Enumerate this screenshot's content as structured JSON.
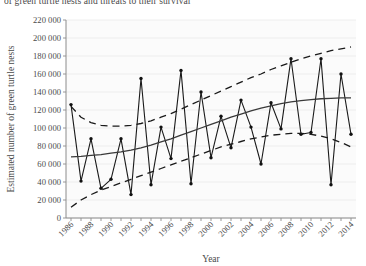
{
  "caption": {
    "clipped_top_text": "of green turtle nests and threats to their survival"
  },
  "chart_data": {
    "type": "line",
    "title": "",
    "subtitle": "",
    "xlabel": "Year",
    "ylabel": "Estimated number of green turtle nests",
    "xlim": [
      1985.5,
      2014.5
    ],
    "ylim": [
      0,
      220000
    ],
    "grid": true,
    "legend_position": "none",
    "y_ticks": [
      0,
      20000,
      40000,
      60000,
      80000,
      100000,
      120000,
      140000,
      160000,
      180000,
      200000,
      220000
    ],
    "y_tick_labels": [
      "0",
      "20 000",
      "40 000",
      "60 000",
      "80 000",
      "100 000",
      "120 000",
      "140 000",
      "160 000",
      "180 000",
      "200 000",
      "220 000"
    ],
    "x_ticks": [
      1986,
      1988,
      1990,
      1992,
      1994,
      1996,
      1998,
      2000,
      2002,
      2004,
      2006,
      2008,
      2010,
      2012,
      2014
    ],
    "x_tick_labels": [
      "1986",
      "1988",
      "1990",
      "1992",
      "1994",
      "1996",
      "1998",
      "2000",
      "2002",
      "2004",
      "2006",
      "2008",
      "2010",
      "2012",
      "2014"
    ],
    "x_minor_ticks_every": 1,
    "x": [
      1986,
      1987,
      1988,
      1989,
      1990,
      1991,
      1992,
      1993,
      1994,
      1995,
      1996,
      1997,
      1998,
      1999,
      2000,
      2001,
      2002,
      2003,
      2004,
      2005,
      2006,
      2007,
      2008,
      2009,
      2010,
      2011,
      2012,
      2013,
      2014
    ],
    "series": [
      {
        "name": "Estimated number of green turtle nests",
        "style": "solid-with-markers",
        "color": "#111111",
        "values": [
          126000,
          41000,
          88000,
          33000,
          43000,
          88000,
          26000,
          155000,
          37000,
          101000,
          66000,
          164000,
          38000,
          140000,
          67000,
          113000,
          78000,
          131000,
          101000,
          60000,
          128000,
          99000,
          177000,
          93000,
          95000,
          177000,
          37000,
          160000,
          93000
        ]
      },
      {
        "name": "Fitted trend",
        "style": "solid",
        "color": "#3a3a3a",
        "values": [
          68000,
          68500,
          69500,
          70500,
          72000,
          73500,
          75500,
          78000,
          81000,
          84500,
          88000,
          92000,
          96000,
          100000,
          104000,
          108000,
          112000,
          115500,
          119000,
          122000,
          124500,
          127000,
          129000,
          130500,
          131500,
          132500,
          133000,
          133500,
          133500
        ]
      },
      {
        "name": "Upper confidence limit",
        "style": "dashed",
        "color": "#1a1a1a",
        "values": [
          124000,
          112000,
          106000,
          103000,
          102000,
          102000,
          103000,
          105000,
          108000,
          112000,
          116000,
          121000,
          126000,
          131000,
          136000,
          141000,
          146000,
          151000,
          156000,
          160000,
          165000,
          169000,
          173000,
          177000,
          180000,
          183000,
          186000,
          188000,
          190000
        ]
      },
      {
        "name": "Lower confidence limit",
        "style": "dashed",
        "color": "#1a1a1a",
        "values": [
          12000,
          20000,
          26000,
          31000,
          35000,
          39000,
          43000,
          47000,
          51000,
          55000,
          59000,
          63000,
          67000,
          71000,
          75000,
          79000,
          82000,
          85000,
          88000,
          90000,
          92000,
          93000,
          94000,
          94000,
          93000,
          91000,
          88000,
          84000,
          79000
        ]
      }
    ]
  }
}
